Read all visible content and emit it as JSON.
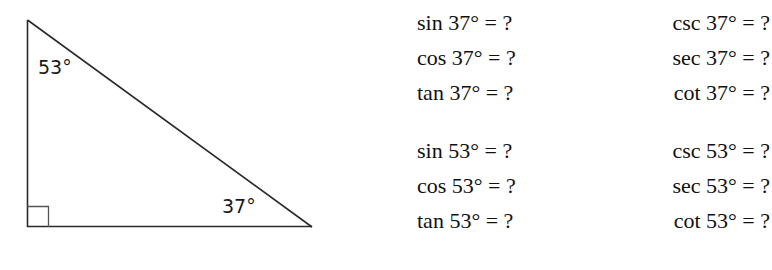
{
  "figure": {
    "name": "right-triangle",
    "angle_top_label": "53°",
    "angle_right_label": "37°",
    "right_angle_marker": "square",
    "stroke_color": "#2a2a2a",
    "vertices": {
      "top": [
        27,
        20
      ],
      "bottom_left": [
        27,
        227
      ],
      "bottom_right": [
        312,
        227
      ]
    }
  },
  "equations": {
    "groups": [
      {
        "angle": "37°",
        "rows": [
          {
            "left": "sin 37° = ?",
            "right": "csc 37° = ?"
          },
          {
            "left": "cos 37° = ?",
            "right": "sec 37° = ?"
          },
          {
            "left": "tan 37° = ?",
            "right": "cot 37° = ?"
          }
        ]
      },
      {
        "angle": "53°",
        "rows": [
          {
            "left": "sin 53° = ?",
            "right": "csc 53° = ?"
          },
          {
            "left": "cos 53° = ?",
            "right": "sec 53° = ?"
          },
          {
            "left": "tan 53° = ?",
            "right": "cot 53° = ?"
          }
        ]
      }
    ]
  },
  "colors": {
    "background": "#ffffff",
    "text": "#111111",
    "line": "#2a2a2a"
  }
}
